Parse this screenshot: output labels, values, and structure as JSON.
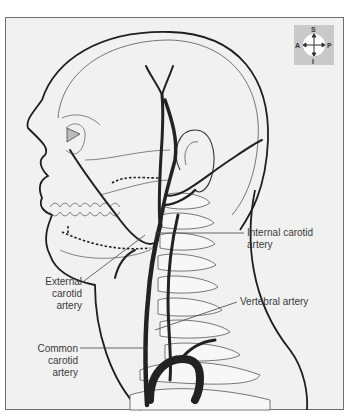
{
  "figure": {
    "colors": {
      "background": "#f1f1f1",
      "frame_border": "#6e6e6e",
      "outline": "#1e1e1e",
      "bone_line": "#555555",
      "artery": "#2a2a2a",
      "compass_bg": "#c9c9c9"
    }
  },
  "compass": {
    "superior": "S",
    "inferior": "I",
    "anterior": "A",
    "posterior": "P"
  },
  "labels": {
    "internal_carotid": [
      "Internal carotid",
      "artery"
    ],
    "external_carotid": [
      "External",
      "carotid",
      "artery"
    ],
    "vertebral": "Vertebral artery",
    "common_carotid": [
      "Common",
      "carotid",
      "artery"
    ]
  }
}
